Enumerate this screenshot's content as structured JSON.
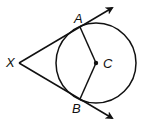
{
  "diagram": {
    "type": "geometry",
    "labels": {
      "x": "X",
      "a": "A",
      "b": "B",
      "c": "C"
    },
    "stroke_color": "#111111",
    "points": {
      "X": [
        19,
        63
      ],
      "A": [
        80,
        27
      ],
      "B": [
        80,
        99
      ],
      "C": [
        96,
        63
      ]
    },
    "circle": {
      "center": "C",
      "radius": 40
    }
  }
}
